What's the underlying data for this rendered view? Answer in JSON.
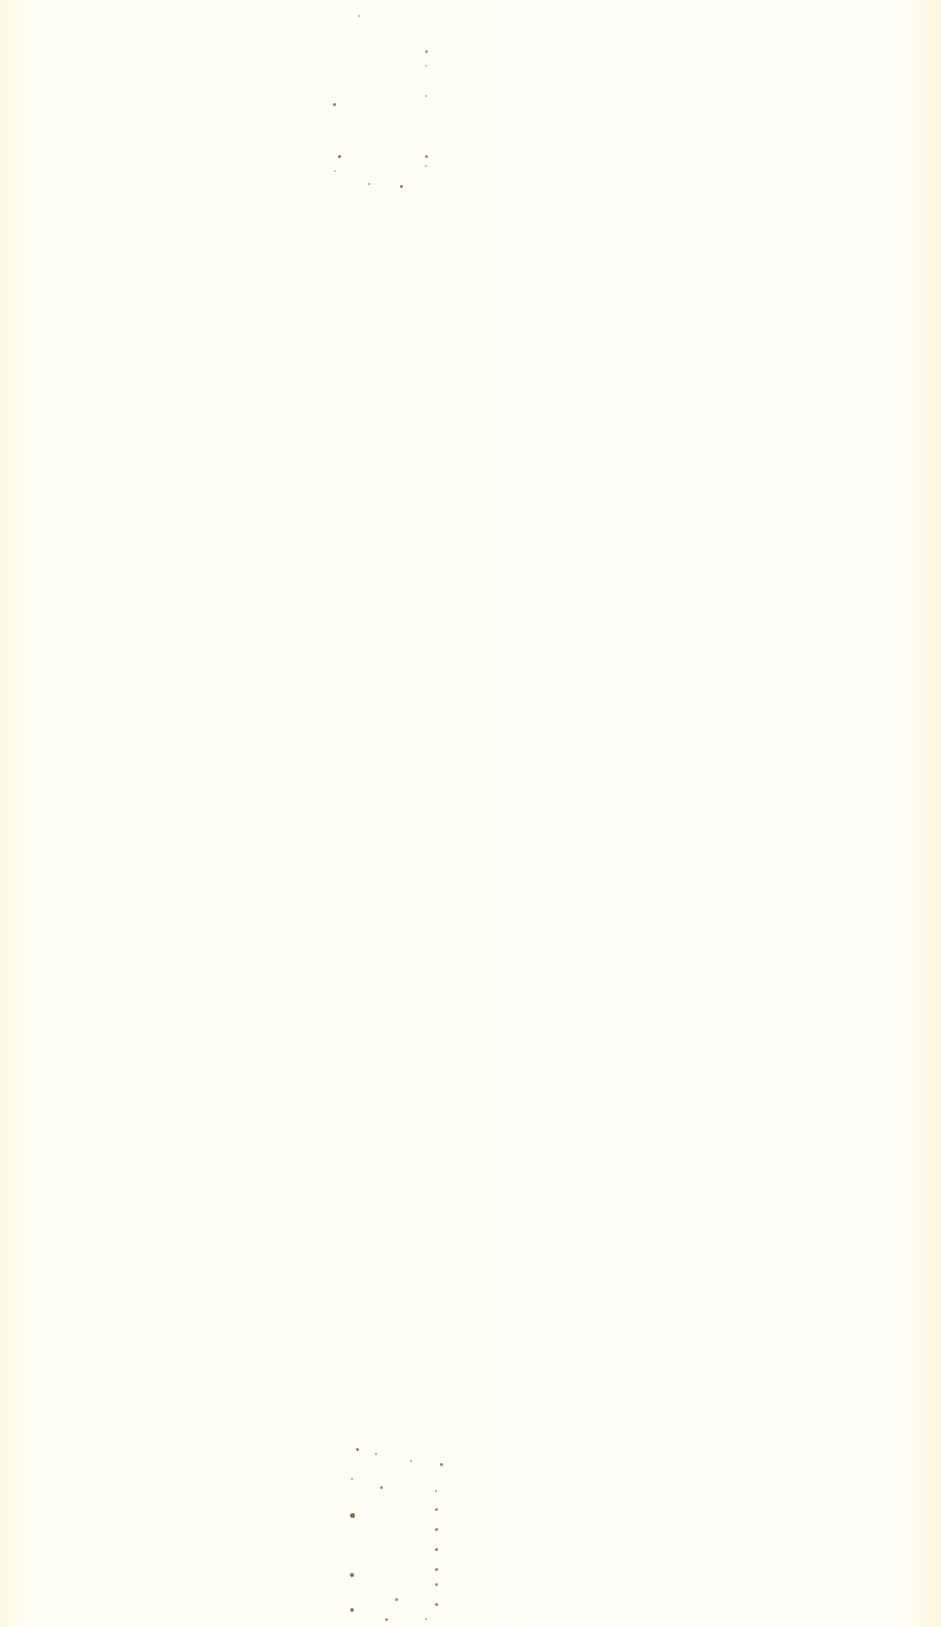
{
  "page": {
    "type": "blank scanned page",
    "background_color": "#fffdf0",
    "text": ""
  },
  "marks": [
    {
      "name": "top-binding-mark",
      "x": 318,
      "y": 10,
      "width": 110,
      "height": 185
    },
    {
      "name": "bottom-binding-mark",
      "x": 350,
      "y": 1448,
      "width": 110,
      "height": 179
    }
  ]
}
